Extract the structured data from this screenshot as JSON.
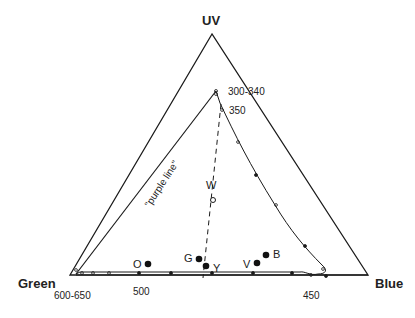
{
  "diagram": {
    "vertices": {
      "top": "UV",
      "left": "Green",
      "right": "Blue"
    },
    "wavelength_labels": {
      "uv_end": "300-340",
      "near_uv": "350",
      "green_end": "600-650",
      "mid_bottom": "500",
      "blue_end": "450"
    },
    "purple_line_label": "\"purple line\"",
    "points": [
      {
        "label": "O",
        "name": "orange"
      },
      {
        "label": "G",
        "name": "green"
      },
      {
        "label": "Y",
        "name": "yellow"
      },
      {
        "label": "V",
        "name": "violet"
      },
      {
        "label": "B",
        "name": "blue"
      },
      {
        "label": "W",
        "name": "white"
      }
    ],
    "colors": {
      "ink": "#1a1a1a",
      "background": "#ffffff"
    }
  }
}
